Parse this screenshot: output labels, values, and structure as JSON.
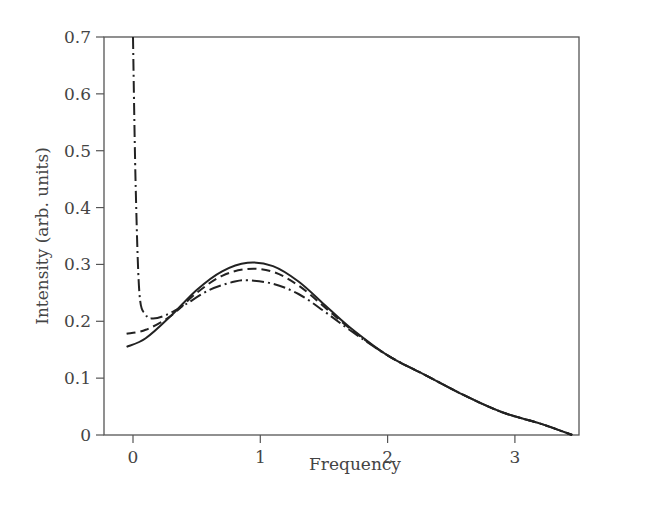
{
  "chart_data": {
    "type": "line",
    "title": "",
    "xlabel": "Frequency",
    "ylabel": "Intensity (arb. units)",
    "xlim": [
      -0.28,
      3.6
    ],
    "ylim": [
      0,
      0.7
    ],
    "x_ticks": [
      "0",
      "1",
      "2",
      "3"
    ],
    "y_ticks": [
      "0",
      "0.1",
      "0.2",
      "0.3",
      "0.4",
      "0.5",
      "0.6",
      "0.7"
    ],
    "grid": false,
    "legend": null,
    "series": [
      {
        "name": "solid",
        "style": "solid",
        "x": [
          -0.05,
          0.1,
          0.3,
          0.5,
          0.7,
          0.9,
          1.1,
          1.3,
          1.5,
          1.7,
          2.0,
          2.3,
          2.6,
          2.9,
          3.2,
          3.45
        ],
        "y": [
          0.155,
          0.17,
          0.21,
          0.255,
          0.288,
          0.303,
          0.297,
          0.27,
          0.23,
          0.19,
          0.14,
          0.105,
          0.07,
          0.04,
          0.02,
          0.0
        ]
      },
      {
        "name": "dashed",
        "style": "dashed",
        "x": [
          -0.05,
          0.1,
          0.3,
          0.5,
          0.7,
          0.9,
          1.1,
          1.3,
          1.5,
          1.7,
          2.0,
          2.3,
          2.6,
          2.9,
          3.2,
          3.45
        ],
        "y": [
          0.178,
          0.185,
          0.21,
          0.25,
          0.28,
          0.292,
          0.287,
          0.263,
          0.226,
          0.188,
          0.14,
          0.105,
          0.07,
          0.04,
          0.02,
          0.0
        ]
      },
      {
        "name": "dash-dot",
        "style": "dashdot",
        "x": [
          0.0,
          0.02,
          0.05,
          0.1,
          0.15,
          0.25,
          0.4,
          0.6,
          0.8,
          0.9,
          1.1,
          1.3,
          1.5,
          1.7,
          2.0,
          2.3,
          2.6,
          2.9,
          3.2,
          3.45
        ],
        "y": [
          0.7,
          0.45,
          0.25,
          0.212,
          0.205,
          0.21,
          0.228,
          0.255,
          0.27,
          0.272,
          0.266,
          0.248,
          0.218,
          0.185,
          0.14,
          0.105,
          0.07,
          0.04,
          0.02,
          0.0
        ]
      }
    ]
  }
}
